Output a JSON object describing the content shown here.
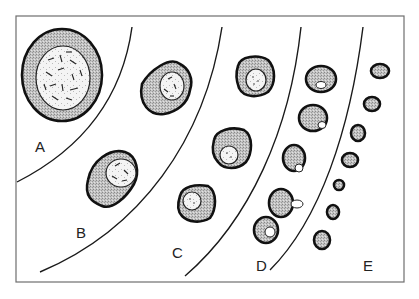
{
  "figure": {
    "stages": [
      {
        "id": "A",
        "label": "A",
        "cell_count": 1,
        "nucleus": "large, chromatin strands"
      },
      {
        "id": "B",
        "label": "B",
        "cell_count": 2,
        "nucleus": "medium, chromatin strands"
      },
      {
        "id": "C",
        "label": "C",
        "cell_count": 3,
        "nucleus": "small, dotted"
      },
      {
        "id": "D",
        "label": "D",
        "cell_count": 6,
        "nucleus": "small, eccentric / extruding"
      },
      {
        "id": "E",
        "label": "E",
        "cell_count": 8,
        "nucleus": "none"
      }
    ]
  },
  "colors": {
    "outline": "#111111",
    "stipple": "#bdbdbd",
    "frame": "#6e6e6e",
    "background": "#ffffff"
  }
}
